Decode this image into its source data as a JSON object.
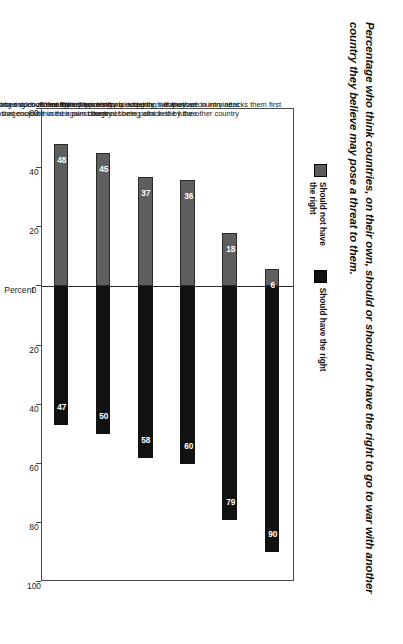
{
  "title": "Percentage who think countries, on their own, should or should not have the right to go to war with another country they believe may pose a threat to them.",
  "legend": {
    "items": [
      {
        "label": "Should not have\nthe right",
        "color": "#5c5c5c",
        "swatch_name": "legend-swatch-should-not-have-the-right"
      },
      {
        "label": "Should have the right",
        "color": "#101010",
        "swatch_name": "legend-swatch-should-have-the-right"
      }
    ]
  },
  "chart_data": {
    "type": "bar",
    "title": "Percentage who think countries, on their own, should or should not have the right to go to war with another country they believe may pose a threat to them.",
    "xlabel": "Percent",
    "ylabel": "",
    "orientation": "vertical-diverging",
    "grid": false,
    "legend_position": "top-left",
    "axis_ticks": [
      "60",
      "40",
      "20",
      "0",
      "20",
      "40",
      "60",
      "80",
      "100"
    ],
    "axis_tick_values": [
      -60,
      -40,
      -20,
      0,
      20,
      40,
      60,
      80,
      100
    ],
    "xlim": [
      -60,
      100
    ],
    "categories": [
      "If another country attacks them first",
      "If they have strong evidence that they are in imminent\ndanger of being attacked by the other country",
      "If they have strong evidence that the other country is acquiring weapons of\nmass destruction that could be used against them at some point in the future",
      "To maintain their territorial integrity",
      "To stop neighboring countries from supporting\nan insurgency within their own country",
      "To preserve access to vital resources such as energy"
    ],
    "series": [
      {
        "name": "Should have the right",
        "color": "#111111",
        "values": [
          90,
          79,
          60,
          58,
          50,
          47
        ]
      },
      {
        "name": "Should not have the right",
        "color": "#5e5e5e",
        "values": [
          6,
          18,
          36,
          37,
          45,
          48
        ]
      }
    ]
  }
}
